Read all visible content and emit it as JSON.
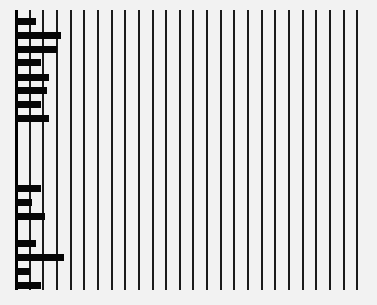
{
  "chart_data": {
    "type": "bar",
    "orientation": "horizontal",
    "title": "",
    "xlabel": "",
    "ylabel": "",
    "grid": true,
    "legend": null,
    "gridline_count": 26,
    "xlim": [
      0,
      25
    ],
    "groups": [
      {
        "name": "group-1",
        "values": [
          1.5,
          3.3,
          3.0,
          1.8,
          2.4,
          2.3,
          1.8,
          2.4
        ]
      },
      {
        "name": "group-2",
        "values": [
          1.8,
          1.2,
          2.1,
          1.5,
          3.5,
          1.0,
          1.8
        ]
      }
    ]
  },
  "layout": {
    "axis_x": 16,
    "grid_step": 13.65,
    "grid_top": 10,
    "grid_bottom": 290,
    "bar_height": 7,
    "group_tops": [
      [
        18,
        32,
        46,
        59,
        74,
        87,
        101,
        115
      ],
      [
        185,
        199,
        213,
        240,
        254,
        268,
        282
      ]
    ],
    "colors": {
      "background": "#f2f2f2",
      "bar": "#050505",
      "grid": "#1a1a1a"
    }
  }
}
